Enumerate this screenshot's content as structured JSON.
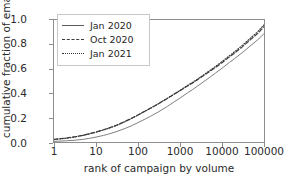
{
  "chart_data": {
    "type": "line",
    "title": "",
    "xlabel": "rank of campaign by volume",
    "ylabel": "cumulative fraction of emails",
    "xscale": "log",
    "yscale": "linear",
    "xlim": [
      1,
      100000
    ],
    "ylim": [
      0.0,
      1.0
    ],
    "grid": false,
    "legend_position": "upper left",
    "xticks": [
      1,
      10,
      100,
      1000,
      10000,
      100000
    ],
    "xticklabels": [
      "1",
      "10",
      "100",
      "1000",
      "10000",
      "100000"
    ],
    "yticks": [
      0.0,
      0.2,
      0.4,
      0.6,
      0.8,
      1.0
    ],
    "yticklabels": [
      "0.0",
      "0.2",
      "0.4",
      "0.6",
      "0.8",
      "1.0"
    ],
    "x": [
      1,
      2,
      3,
      5,
      7,
      10,
      15,
      20,
      30,
      50,
      70,
      100,
      150,
      200,
      300,
      500,
      700,
      1000,
      1500,
      2000,
      3000,
      5000,
      7000,
      10000,
      15000,
      20000,
      30000,
      50000,
      70000,
      100000
    ],
    "series": [
      {
        "name": "Jan 2020",
        "linestyle": "solid",
        "color": "#7f7f7f",
        "values": [
          0.005,
          0.01,
          0.014,
          0.022,
          0.03,
          0.04,
          0.054,
          0.065,
          0.084,
          0.112,
          0.133,
          0.159,
          0.189,
          0.211,
          0.245,
          0.292,
          0.325,
          0.36,
          0.402,
          0.43,
          0.473,
          0.528,
          0.565,
          0.605,
          0.652,
          0.684,
          0.731,
          0.795,
          0.836,
          0.888
        ]
      },
      {
        "name": "Oct 2020",
        "linestyle": "dashed",
        "color": "#3a3a3a",
        "values": [
          0.022,
          0.033,
          0.042,
          0.056,
          0.068,
          0.082,
          0.1,
          0.114,
          0.136,
          0.17,
          0.194,
          0.222,
          0.255,
          0.278,
          0.312,
          0.357,
          0.388,
          0.42,
          0.459,
          0.484,
          0.524,
          0.576,
          0.611,
          0.65,
          0.697,
          0.729,
          0.778,
          0.845,
          0.888,
          0.945
        ]
      },
      {
        "name": "Jan 2021",
        "linestyle": "dotted",
        "color": "#3a3a3a",
        "values": [
          0.02,
          0.031,
          0.04,
          0.054,
          0.066,
          0.08,
          0.098,
          0.112,
          0.134,
          0.168,
          0.192,
          0.221,
          0.254,
          0.277,
          0.312,
          0.358,
          0.39,
          0.423,
          0.463,
          0.489,
          0.53,
          0.583,
          0.619,
          0.659,
          0.707,
          0.74,
          0.79,
          0.858,
          0.902,
          0.96
        ]
      }
    ]
  },
  "axes": {
    "ylabel": "cumulative fraction of emails",
    "xlabel": "rank of campaign by volume",
    "yticklabels": [
      "0.0",
      "0.2",
      "0.4",
      "0.6",
      "0.8",
      "1.0"
    ],
    "xticklabels": [
      "1",
      "10",
      "100",
      "1000",
      "10000",
      "100000"
    ]
  },
  "legend": {
    "items": [
      {
        "label": "Jan 2020",
        "style": "solid"
      },
      {
        "label": "Oct 2020",
        "style": "dashed"
      },
      {
        "label": "Jan 2021",
        "style": "dotted"
      }
    ]
  }
}
